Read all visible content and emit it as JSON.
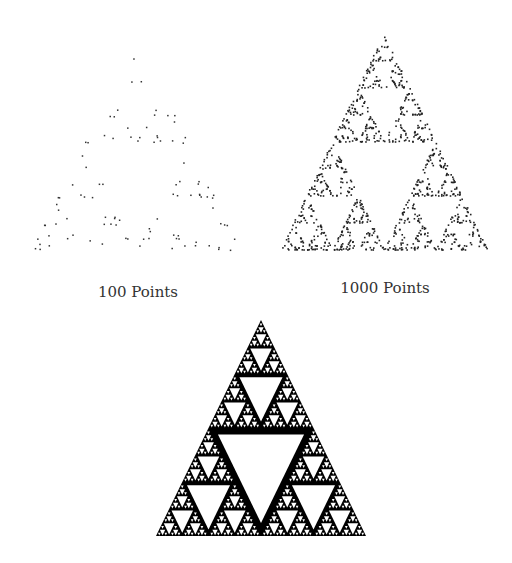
{
  "figures": [
    {
      "id": "chaos-100",
      "caption": "100 Points",
      "points": 100,
      "apex": [
        136,
        36
      ],
      "base_left": [
        31,
        253
      ],
      "base_right": [
        242,
        253
      ],
      "caption_pos": [
        138,
        283
      ],
      "dot_color": "#333333",
      "seed": 7
    },
    {
      "id": "chaos-1000",
      "caption": "1000 Points",
      "points": 1000,
      "apex": [
        384,
        34
      ],
      "base_left": [
        281,
        250
      ],
      "base_right": [
        488,
        250
      ],
      "caption_pos": [
        385,
        279
      ],
      "dot_color": "#222222",
      "seed": 11
    },
    {
      "id": "sierpinski-full",
      "caption": "",
      "depth": 6,
      "apex": [
        261,
        320
      ],
      "base_left": [
        156,
        536
      ],
      "base_right": [
        366,
        536
      ],
      "fill_color": "#000000"
    }
  ]
}
